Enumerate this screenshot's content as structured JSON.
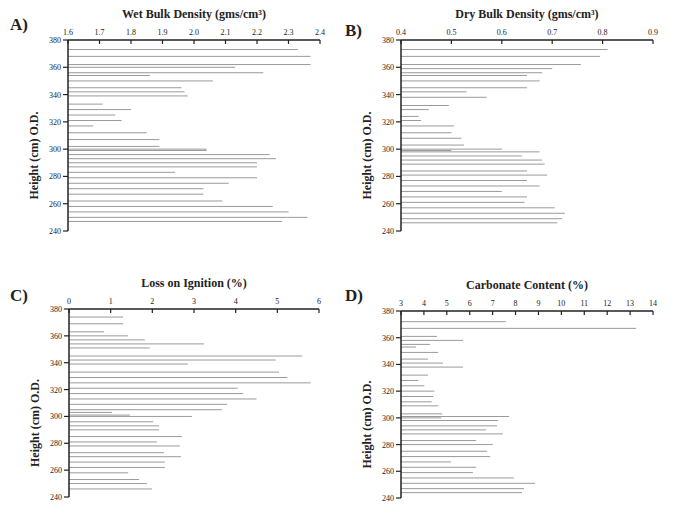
{
  "chart_data": [
    {
      "panel": "A)",
      "type": "bar",
      "orientation": "horizontal",
      "title": "Wet Bulk Density (gms/cm³)",
      "xlabel": "Wet Bulk Density (gms/cm³)",
      "ylabel": "Height (cm) O.D.",
      "xlim": [
        1.6,
        2.4
      ],
      "xticks": [
        "1.6",
        "1.7",
        "1.8",
        "1.9",
        "2.0",
        "2.1",
        "2.2",
        "2.3",
        "2.4"
      ],
      "ylim": [
        240,
        380
      ],
      "yticks": [
        "240",
        "260",
        "280",
        "300",
        "320",
        "340",
        "360",
        "380"
      ],
      "heights": [
        373,
        368,
        362,
        360,
        356,
        354,
        350,
        345,
        342,
        339,
        333,
        329,
        325,
        321,
        317,
        312,
        307,
        302,
        300,
        299,
        296,
        293,
        290,
        287,
        283,
        279,
        275,
        271,
        267,
        262,
        258,
        254,
        250,
        247
      ],
      "values": [
        2.33,
        2.37,
        2.37,
        2.13,
        2.22,
        1.86,
        2.06,
        1.96,
        1.97,
        1.98,
        1.71,
        1.8,
        1.75,
        1.77,
        1.68,
        1.85,
        1.89,
        1.89,
        2.04,
        2.04,
        2.24,
        2.26,
        2.2,
        2.2,
        1.94,
        2.2,
        2.11,
        2.03,
        2.03,
        2.09,
        2.25,
        2.3,
        2.36,
        2.28
      ]
    },
    {
      "panel": "B)",
      "type": "bar",
      "orientation": "horizontal",
      "title": "Dry Bulk Density (gms/cm³)",
      "xlabel": "Dry Bulk Density (gms/cm³)",
      "ylabel": "Height (cm) O.D.",
      "xlim": [
        0.4,
        0.9
      ],
      "xticks": [
        "0.4",
        "0.5",
        "0.6",
        "0.7",
        "0.8",
        "0.9"
      ],
      "ylim": [
        240,
        380
      ],
      "yticks": [
        "240",
        "260",
        "280",
        "300",
        "320",
        "340",
        "360",
        "380"
      ],
      "heights": [
        373,
        368,
        362,
        359,
        356,
        354,
        350,
        345,
        342,
        338,
        332,
        329,
        324,
        321,
        317,
        312,
        308,
        303,
        300,
        299,
        298,
        295,
        292,
        289,
        284,
        281,
        277,
        273,
        269,
        265,
        261,
        257,
        253,
        249,
        246
      ],
      "values": [
        0.81,
        0.795,
        0.757,
        0.7,
        0.68,
        0.65,
        0.675,
        0.65,
        0.53,
        0.57,
        0.495,
        0.455,
        0.435,
        0.44,
        0.505,
        0.5,
        0.52,
        0.525,
        0.6,
        0.5,
        0.675,
        0.64,
        0.68,
        0.685,
        0.65,
        0.69,
        0.65,
        0.675,
        0.6,
        0.65,
        0.645,
        0.705,
        0.725,
        0.72,
        0.71
      ]
    },
    {
      "panel": "C)",
      "type": "bar",
      "orientation": "horizontal",
      "title": "Loss on Ignition (%)",
      "xlabel": "Loss on Ignition (%)",
      "ylabel": "Height (cm) O.D.",
      "xlim": [
        0,
        6
      ],
      "xticks": [
        "0",
        "1",
        "2",
        "3",
        "4",
        "5",
        "6"
      ],
      "ylim": [
        240,
        380
      ],
      "yticks": [
        "240",
        "260",
        "280",
        "300",
        "320",
        "340",
        "360",
        "380"
      ],
      "heights": [
        374,
        369,
        363,
        360,
        357,
        354,
        351,
        345,
        342,
        339,
        333,
        329,
        325,
        321,
        317,
        313,
        309,
        305,
        303,
        301,
        300,
        296,
        293,
        290,
        285,
        281,
        278,
        273,
        270,
        266,
        262,
        258,
        253,
        250,
        246
      ],
      "values": [
        1.3,
        1.3,
        0.84,
        1.42,
        1.82,
        3.24,
        1.94,
        5.6,
        4.96,
        2.85,
        5.04,
        5.24,
        5.8,
        4.05,
        4.18,
        4.5,
        3.79,
        3.67,
        1.03,
        1.46,
        2.95,
        2.02,
        2.16,
        2.16,
        2.71,
        2.11,
        2.66,
        2.28,
        2.69,
        2.3,
        2.3,
        1.42,
        1.68,
        1.87,
        1.99
      ]
    },
    {
      "panel": "D)",
      "type": "bar",
      "orientation": "horizontal",
      "title": "Carbonate Content (%)",
      "xlabel": "Carbonate Content (%)",
      "ylabel": "Height (cm) O.D.",
      "xlim": [
        3,
        14
      ],
      "xticks": [
        "3",
        "4",
        "5",
        "6",
        "7",
        "8",
        "9",
        "10",
        "11",
        "12",
        "13",
        "14"
      ],
      "ylim": [
        240,
        380
      ],
      "yticks": [
        "240",
        "260",
        "280",
        "300",
        "320",
        "340",
        "360",
        "380"
      ],
      "heights": [
        372,
        367,
        361,
        358,
        355,
        353,
        349,
        344,
        341,
        338,
        332,
        328,
        324,
        320,
        316,
        312,
        309,
        303,
        301,
        300,
        298,
        294,
        291,
        288,
        283,
        280,
        275,
        271,
        267,
        263,
        259,
        255,
        251,
        247,
        244
      ],
      "values": [
        7.58,
        13.26,
        4.57,
        5.71,
        4.27,
        3.66,
        4.62,
        4.18,
        4.83,
        5.71,
        4.18,
        3.76,
        4.02,
        4.46,
        4.41,
        4.34,
        4.62,
        4.8,
        7.72,
        4.75,
        7.24,
        7.19,
        6.71,
        7.45,
        6.28,
        7.0,
        6.76,
        6.89,
        5.18,
        6.28,
        6.14,
        7.93,
        8.85,
        8.37,
        8.28
      ]
    }
  ],
  "colors": {
    "axis": "#222222",
    "bar_line": "#9a9a9a"
  }
}
